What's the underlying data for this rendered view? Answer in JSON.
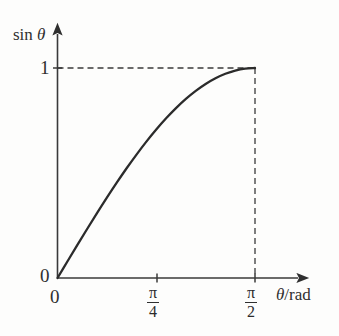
{
  "figure": {
    "kind": "line-plot",
    "background_color": "#fdfdfc",
    "ink_color": "#2f2f2f"
  },
  "axes": {
    "y_axis_label": "sin",
    "y_axis_label_symbol": "θ",
    "x_axis_label_symbol": "θ",
    "x_axis_label_unit": "/rad",
    "origin_label_y": "0",
    "origin_label_x": "0",
    "y_tick_label_one": "1",
    "x_tick_pi_over_4": {
      "numerator": "π",
      "denominator": "4"
    },
    "x_tick_pi_over_2": {
      "numerator": "π",
      "denominator": "2"
    }
  },
  "chart_data": {
    "type": "line",
    "title": "",
    "xlabel": "θ /rad",
    "ylabel": "sin θ",
    "xlim": [
      0,
      1.9634954
    ],
    "ylim": [
      0,
      1.12
    ],
    "grid": false,
    "legend": null,
    "x_tick_values": [
      0,
      0.7853982,
      1.5707963
    ],
    "x_tick_labels": [
      "0",
      "π/4",
      "π/2"
    ],
    "y_tick_values": [
      0,
      1
    ],
    "y_tick_labels": [
      "0",
      "1"
    ],
    "annotations": [
      {
        "kind": "dashed-guide",
        "orientation": "horizontal",
        "value": 1,
        "from_x": 0,
        "to_x": 1.5707963
      },
      {
        "kind": "dashed-guide",
        "orientation": "vertical",
        "value": 1.5707963,
        "from_y": 0,
        "to_y": 1
      }
    ],
    "series": [
      {
        "name": "sin θ",
        "x": [
          0,
          0.0785398,
          0.1570796,
          0.2356194,
          0.3141593,
          0.3926991,
          0.4712389,
          0.5497787,
          0.6283185,
          0.7068583,
          0.7853982,
          0.863938,
          0.9424778,
          1.0210176,
          1.0995574,
          1.1780972,
          1.256637,
          1.3351769,
          1.4137167,
          1.4922565,
          1.5707963
        ],
        "y": [
          0,
          0.0784591,
          0.1564345,
          0.2334454,
          0.309017,
          0.3826834,
          0.4539905,
          0.5224986,
          0.5877853,
          0.649448,
          0.7071068,
          0.760406,
          0.809017,
          0.8526402,
          0.8910065,
          0.9238795,
          0.9510565,
          0.9723699,
          0.9876883,
          0.9969173,
          1.0
        ]
      }
    ]
  }
}
